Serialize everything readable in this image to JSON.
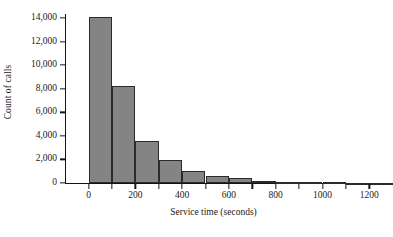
{
  "chart_data": {
    "type": "bar",
    "title": "",
    "subtitle": "",
    "xlabel": "Service time (seconds)",
    "ylabel": "Count of calls",
    "grid": false,
    "legend": null,
    "bin_width": 100,
    "xlim": [
      -50,
      1300
    ],
    "ylim": [
      0,
      14800
    ],
    "xticks": [
      0,
      200,
      400,
      600,
      800,
      1000,
      1200
    ],
    "xtick_labels": [
      "0",
      "200",
      "400",
      "600",
      "800",
      "1000",
      "1200"
    ],
    "yticks": [
      0,
      2000,
      4000,
      6000,
      8000,
      10000,
      12000,
      14000
    ],
    "ytick_labels": [
      "0",
      "2,000",
      "4,000",
      "6,000",
      "8,000",
      "10,000",
      "12,000",
      "14,000"
    ],
    "bin_starts": [
      0,
      100,
      200,
      300,
      400,
      500,
      600,
      700,
      800,
      900,
      1000,
      1100,
      1200
    ],
    "categories": [
      "0-100",
      "100-200",
      "200-300",
      "300-400",
      "400-500",
      "500-600",
      "600-700",
      "700-800",
      "800-900",
      "900-1000",
      "1000-1100",
      "1100-1200",
      "1200-1300"
    ],
    "values": [
      14100,
      8250,
      3600,
      1950,
      1050,
      620,
      400,
      210,
      120,
      80,
      50,
      30,
      20
    ],
    "bar_color": "#848484",
    "bar_edge_color": "#2b2b2b",
    "axis_color": "#141414"
  }
}
